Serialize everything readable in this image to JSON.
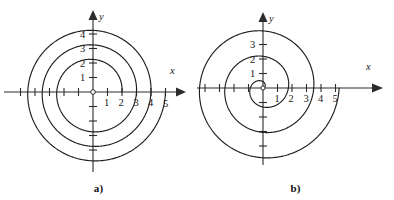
{
  "figure": {
    "background_color": "#ffffff",
    "curve_color": "#1f1f1f",
    "axis_color": "#2b2b2b"
  },
  "panels": [
    {
      "id": "a",
      "caption": "a)",
      "axis_x_label": "x",
      "axis_y_label": "y",
      "origin_label": "O",
      "x_tick_labels": [
        "1",
        "2",
        "3",
        "4",
        "5"
      ],
      "y_tick_labels": [
        "1",
        "2",
        "3",
        "4"
      ],
      "chart_data": {
        "type": "line",
        "title": "",
        "subtitle": "",
        "xlabel": "x",
        "ylabel": "y",
        "grid": false,
        "legend": "none",
        "coordinate_system": "polar",
        "curve_name": "Archimedean spiral r = 2 + theta/(2*pi)",
        "r_at_theta_0": 2,
        "r_growth_per_turn": 1,
        "theta_start_rad": 0,
        "theta_end_rad": 18.85,
        "turns": 3,
        "xlim": [
          -5,
          5
        ],
        "ylim": [
          -5,
          5
        ],
        "x_ticks": [
          1,
          2,
          3,
          4,
          5
        ],
        "y_ticks": [
          1,
          2,
          3,
          4
        ],
        "x_axis_crossings_positive": [
          2,
          3,
          4,
          5
        ],
        "y_axis_crossings_positive": [
          2.25,
          3.25,
          4.25
        ],
        "samples": [
          {
            "theta": 0.0,
            "r": 2.0,
            "x": 2.0,
            "y": 0.0
          },
          {
            "theta": 1.571,
            "r": 2.25,
            "x": 0.0,
            "y": 2.25
          },
          {
            "theta": 3.142,
            "r": 2.5,
            "x": -2.5,
            "y": 0.0
          },
          {
            "theta": 4.712,
            "r": 2.75,
            "x": 0.0,
            "y": -2.75
          },
          {
            "theta": 6.283,
            "r": 3.0,
            "x": 3.0,
            "y": 0.0
          },
          {
            "theta": 7.854,
            "r": 3.25,
            "x": 0.0,
            "y": 3.25
          },
          {
            "theta": 9.425,
            "r": 3.5,
            "x": -3.5,
            "y": 0.0
          },
          {
            "theta": 10.996,
            "r": 3.75,
            "x": 0.0,
            "y": -3.75
          },
          {
            "theta": 12.566,
            "r": 4.0,
            "x": 4.0,
            "y": 0.0
          },
          {
            "theta": 14.137,
            "r": 4.25,
            "x": 0.0,
            "y": 4.25
          },
          {
            "theta": 15.708,
            "r": 4.5,
            "x": -4.5,
            "y": 0.0
          },
          {
            "theta": 17.279,
            "r": 4.75,
            "x": 0.0,
            "y": -4.75
          },
          {
            "theta": 18.85,
            "r": 5.0,
            "x": 5.0,
            "y": 0.0
          }
        ]
      }
    },
    {
      "id": "b",
      "caption": "b)",
      "axis_x_label": "x",
      "axis_y_label": "y",
      "origin_label": "O",
      "x_tick_labels": [
        "1",
        "2",
        "3",
        "4",
        "5"
      ],
      "y_tick_labels": [
        "1",
        "2",
        "3"
      ],
      "chart_data": {
        "type": "line",
        "title": "",
        "subtitle": "",
        "xlabel": "x",
        "ylabel": "y",
        "grid": false,
        "legend": "none",
        "coordinate_system": "polar",
        "curve_name": "Archimedean spiral r = theta/(2*pi) * 1.75",
        "r_at_theta_0": 0,
        "r_growth_per_turn": 1.75,
        "theta_start_rad": 0,
        "theta_end_rad": 18.85,
        "turns": 3,
        "xlim": [
          -5,
          5
        ],
        "ylim": [
          -5,
          5
        ],
        "x_ticks": [
          1,
          2,
          3,
          4,
          5
        ],
        "y_ticks": [
          1,
          2,
          3
        ],
        "x_axis_crossings_positive": [
          0.6,
          1.4,
          2.8,
          5.0
        ],
        "y_axis_crossings_positive": [
          0.45,
          1.2,
          2.1,
          3.1
        ],
        "samples": [
          {
            "theta": 0.0,
            "r": 0.0,
            "x": 0.0,
            "y": 0.0
          },
          {
            "theta": 1.571,
            "r": 0.44,
            "x": 0.0,
            "y": 0.44
          },
          {
            "theta": 3.142,
            "r": 0.88,
            "x": -0.88,
            "y": 0.0
          },
          {
            "theta": 4.712,
            "r": 1.31,
            "x": 0.0,
            "y": -1.31
          },
          {
            "theta": 6.283,
            "r": 1.4,
            "x": 1.4,
            "y": 0.0
          },
          {
            "theta": 7.854,
            "r": 1.2,
            "x": 0.0,
            "y": 1.2
          },
          {
            "theta": 9.425,
            "r": 1.9,
            "x": -1.9,
            "y": 0.0
          },
          {
            "theta": 10.996,
            "r": 2.5,
            "x": 0.0,
            "y": -2.5
          },
          {
            "theta": 12.566,
            "r": 2.8,
            "x": 2.8,
            "y": 0.0
          },
          {
            "theta": 14.137,
            "r": 3.1,
            "x": 0.0,
            "y": 3.1
          },
          {
            "theta": 15.708,
            "r": 3.8,
            "x": -3.8,
            "y": 0.0
          },
          {
            "theta": 17.279,
            "r": 4.4,
            "x": 0.0,
            "y": -4.4
          },
          {
            "theta": 18.85,
            "r": 5.0,
            "x": 5.0,
            "y": 0.0
          }
        ]
      }
    }
  ]
}
